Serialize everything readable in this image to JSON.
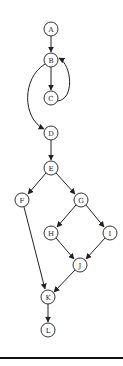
{
  "diagram": {
    "type": "control-flow-graph",
    "nodes": [
      {
        "id": "A",
        "label": "A",
        "x": 51,
        "y": 29
      },
      {
        "id": "B",
        "label": "B",
        "x": 51,
        "y": 60
      },
      {
        "id": "C",
        "label": "C",
        "x": 51,
        "y": 98
      },
      {
        "id": "D",
        "label": "D",
        "x": 51,
        "y": 133
      },
      {
        "id": "E",
        "label": "E",
        "x": 51,
        "y": 168
      },
      {
        "id": "F",
        "label": "F",
        "x": 22,
        "y": 200
      },
      {
        "id": "G",
        "label": "G",
        "x": 81,
        "y": 200
      },
      {
        "id": "H",
        "label": "H",
        "x": 51,
        "y": 233
      },
      {
        "id": "I",
        "label": "I",
        "x": 110,
        "y": 233
      },
      {
        "id": "J",
        "label": "J",
        "x": 80,
        "y": 265
      },
      {
        "id": "K",
        "label": "K",
        "x": 48,
        "y": 297
      },
      {
        "id": "L",
        "label": "L",
        "x": 48,
        "y": 330
      }
    ],
    "edges": [
      {
        "from": "A",
        "to": "B"
      },
      {
        "from": "B",
        "to": "C"
      },
      {
        "from": "C",
        "to": "B",
        "curved": true
      },
      {
        "from": "B",
        "to": "D",
        "curved": true
      },
      {
        "from": "D",
        "to": "E"
      },
      {
        "from": "E",
        "to": "F"
      },
      {
        "from": "E",
        "to": "G"
      },
      {
        "from": "G",
        "to": "H"
      },
      {
        "from": "G",
        "to": "I"
      },
      {
        "from": "H",
        "to": "J"
      },
      {
        "from": "I",
        "to": "J"
      },
      {
        "from": "F",
        "to": "K"
      },
      {
        "from": "J",
        "to": "K"
      },
      {
        "from": "K",
        "to": "L"
      }
    ],
    "colors": {
      "stroke": "#222222",
      "node_fill": "#ffffff",
      "rule": "#111111"
    }
  }
}
